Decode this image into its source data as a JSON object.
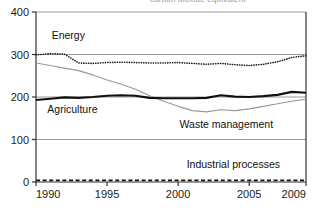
{
  "title_partial": "carbon dioxide equivalent",
  "chart_data": {
    "type": "line",
    "title": "carbon dioxide equivalent",
    "xlabel": "",
    "ylabel": "",
    "xlim": [
      1990,
      2009
    ],
    "ylim": [
      0,
      400
    ],
    "grid": true,
    "gridlines_y": [
      100,
      200,
      300,
      400
    ],
    "legend_position": "inline-annotations",
    "xticks": [
      1990,
      1995,
      2000,
      2005,
      2009
    ],
    "xtick_labels": [
      "1990",
      "1995",
      "2000",
      "2005",
      "2009"
    ],
    "yticks": [
      0,
      100,
      200,
      300,
      400
    ],
    "ytick_labels": [
      "0",
      "100",
      "200",
      "300",
      "400"
    ],
    "x": [
      1990,
      1991,
      1992,
      1993,
      1994,
      1995,
      1996,
      1997,
      1998,
      1999,
      2000,
      2001,
      2002,
      2003,
      2004,
      2005,
      2006,
      2007,
      2008,
      2009
    ],
    "series": [
      {
        "name": "Energy",
        "style": "dotted",
        "color": "#1a1a1a",
        "values": [
          299,
          302,
          301,
          280,
          279,
          281,
          282,
          281,
          280,
          280,
          281,
          279,
          277,
          279,
          276,
          274,
          277,
          283,
          293,
          297
        ]
      },
      {
        "name": "Waste management",
        "style": "solid-thin",
        "color": "#999999",
        "values": [
          280,
          274,
          268,
          262,
          252,
          240,
          230,
          218,
          203,
          190,
          178,
          168,
          165,
          170,
          168,
          172,
          178,
          184,
          190,
          195
        ]
      },
      {
        "name": "Agriculture",
        "style": "solid-thick",
        "color": "#111111",
        "values": [
          193,
          196,
          199,
          198,
          200,
          203,
          204,
          203,
          198,
          197,
          197,
          197,
          198,
          204,
          201,
          200,
          202,
          205,
          212,
          210
        ]
      },
      {
        "name": "Industrial processes",
        "style": "dashed",
        "color": "#111111",
        "values": [
          4,
          4,
          4,
          4,
          4,
          4,
          4,
          4,
          4,
          4,
          4,
          4,
          4,
          4,
          4,
          4,
          4,
          4,
          4,
          4
        ]
      }
    ],
    "annotations": [
      {
        "text": "Energy",
        "x": 1991.1,
        "y": 336
      },
      {
        "text": "Agriculture",
        "x": 1990.8,
        "y": 163
      },
      {
        "text": "Waste management",
        "x": 2000.1,
        "y": 128
      },
      {
        "text": "Industrial processes",
        "x": 2000.6,
        "y": 32
      }
    ]
  },
  "axis_colors": {
    "frame": "#333333",
    "gridline": "#9a9a9a",
    "tick": "#333333"
  }
}
